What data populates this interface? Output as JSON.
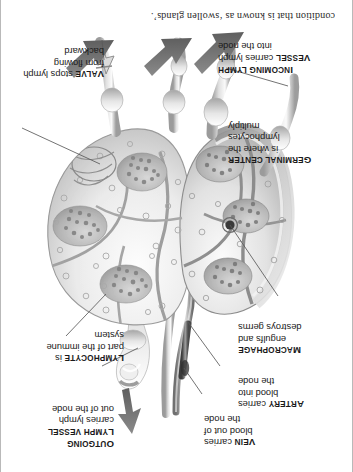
{
  "page": {
    "orientation": "rotated-180",
    "background": "#ffffff",
    "border_color": "#b9b9b9"
  },
  "body_text": {
    "line": "condition that is known as ‘swollen glands’."
  },
  "callouts": [
    {
      "id": "vein",
      "term": "Vein",
      "term_caps": "V",
      "term_rest": "EIN",
      "text": " carries blood out of the node",
      "lines": [
        "carries",
        "blood out of",
        "the node"
      ]
    },
    {
      "id": "artery",
      "term": "Artery",
      "term_caps": "A",
      "term_rest": "RTERY",
      "text": " carries blood into the node",
      "lines": [
        "carries",
        "blood into",
        "the node"
      ]
    },
    {
      "id": "macrophage",
      "term": "Macrophage",
      "term_caps": "M",
      "term_rest": "ACROPHAGE",
      "text": " engulfs and destroys germs",
      "lines": [
        "engulfs and",
        "destroys germs"
      ]
    },
    {
      "id": "germinal-center",
      "term": "Germinal center",
      "term_caps": "G",
      "term_rest": "ERMINAL CENTER",
      "text": " is where the lymphocytes multiply",
      "lines": [
        "is where the",
        "lymphocytes",
        "multiply"
      ]
    },
    {
      "id": "incoming-lymph-vessel",
      "term": "Incoming lymph vessel",
      "term_caps": "I",
      "term_rest": "NCOMING LYMPH",
      "term_line2_caps": "V",
      "term_line2_rest": "ESSEL",
      "text": " carries lymph into the node",
      "lines": [
        "carries lymph",
        "into the node"
      ]
    },
    {
      "id": "outgoing-lymph-vessel",
      "term": "Outgoing lymph vessel",
      "term_caps": "O",
      "term_rest": "UTGOING",
      "term_line2_caps": "L",
      "term_line2_rest": "YMPH VESSEL",
      "text": " carries lymph out of the node",
      "lines": [
        "carries lymph",
        "out of the node"
      ]
    },
    {
      "id": "lymphocyte",
      "term": "Lymphocyte",
      "term_caps": "L",
      "term_rest": "YMPHOCYTE",
      "text": " is part of the immune system",
      "lines": [
        "is",
        "part of the immune",
        "system"
      ]
    },
    {
      "id": "valve",
      "term": "Valve",
      "term_caps": "V",
      "term_rest": "ALVE",
      "text": " stops lymph from flowing backward",
      "lines": [
        "stops lymph",
        "from flowing",
        "backward"
      ]
    }
  ],
  "colors": {
    "ink": "#1a1a1a",
    "leader": "#5a5a5a",
    "arrow": "#6e6e6e",
    "tissue_light": "#f2f2f2",
    "tissue_mid": "#c9c9c9",
    "tissue_dark": "#8e8e8e",
    "capsule": "#9a9a9a"
  },
  "flow_arrows": [
    {
      "id": "outgoing-flow-arrow",
      "direction": "out-of-node"
    },
    {
      "id": "incoming-flow-arrow-left",
      "direction": "into-node"
    },
    {
      "id": "incoming-flow-arrow-middle",
      "direction": "into-node"
    },
    {
      "id": "incoming-flow-arrow-right",
      "direction": "into-node"
    }
  ]
}
